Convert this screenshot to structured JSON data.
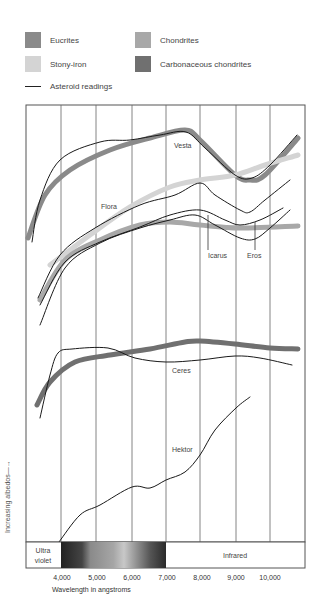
{
  "chart_data": {
    "type": "line",
    "title": "",
    "xlabel": "Wavelength in angstroms",
    "ylabel": "Increasing albedos",
    "xlim": [
      3000,
      11000
    ],
    "x_ticks": [
      "4,000",
      "5,000",
      "6,000",
      "7,000",
      "8,000",
      "9,000",
      "10,000"
    ],
    "grid": "vertical",
    "legend_position": "top",
    "legend": [
      {
        "label": "Eucrites",
        "color": "#8a8a8a",
        "kind": "band"
      },
      {
        "label": "Chondrites",
        "color": "#a8a8a8",
        "kind": "band"
      },
      {
        "label": "Stony-iron",
        "color": "#d4d4d4",
        "kind": "band"
      },
      {
        "label": "Carbonaceous chondrites",
        "color": "#707070",
        "kind": "band"
      },
      {
        "label": "Asteroid readings",
        "color": "#1a1a1a",
        "kind": "line"
      }
    ],
    "spectrum_band": {
      "left_label": [
        "Ultra",
        "violet"
      ],
      "right_label": "Infrared",
      "visible_range": [
        4000,
        7000
      ]
    },
    "series": [
      {
        "name": "Eucrites (meteorite band)",
        "kind": "band",
        "color": "#8a8a8a",
        "points": [
          [
            28,
            238
          ],
          [
            45,
            195
          ],
          [
            70,
            170
          ],
          [
            110,
            150
          ],
          [
            150,
            138
          ],
          [
            185,
            130
          ],
          [
            200,
            140
          ],
          [
            235,
            175
          ],
          [
            250,
            180
          ],
          [
            265,
            175
          ],
          [
            298,
            138
          ]
        ]
      },
      {
        "name": "Vesta",
        "kind": "reading",
        "label": "Vesta",
        "label_xy": [
          174,
          148
        ],
        "points": [
          [
            32,
            242
          ],
          [
            40,
            200
          ],
          [
            60,
            160
          ],
          [
            100,
            142
          ],
          [
            130,
            140
          ],
          [
            160,
            135
          ],
          [
            186,
            132
          ],
          [
            205,
            148
          ],
          [
            235,
            175
          ],
          [
            252,
            178
          ],
          [
            270,
            165
          ],
          [
            297,
            135
          ]
        ]
      },
      {
        "name": "Stony-iron (meteorite band)",
        "kind": "band",
        "color": "#d4d4d4",
        "points": [
          [
            50,
            265
          ],
          [
            90,
            235
          ],
          [
            130,
            207
          ],
          [
            170,
            187
          ],
          [
            200,
            180
          ],
          [
            235,
            175
          ],
          [
            265,
            165
          ],
          [
            298,
            155
          ]
        ]
      },
      {
        "name": "Flora",
        "kind": "reading",
        "label": "Flora",
        "label_xy": [
          101,
          209
        ],
        "points": [
          [
            38,
            298
          ],
          [
            60,
            255
          ],
          [
            95,
            228
          ],
          [
            140,
            205
          ],
          [
            175,
            195
          ],
          [
            200,
            183
          ],
          [
            215,
            195
          ],
          [
            240,
            210
          ],
          [
            250,
            212
          ],
          [
            265,
            200
          ],
          [
            290,
            180
          ]
        ]
      },
      {
        "name": "Chondrites (meteorite band)",
        "kind": "band",
        "color": "#a8a8a8",
        "points": [
          [
            40,
            300
          ],
          [
            65,
            260
          ],
          [
            100,
            240
          ],
          [
            140,
            225
          ],
          [
            170,
            222
          ],
          [
            200,
            225
          ],
          [
            240,
            228
          ],
          [
            298,
            226
          ]
        ]
      },
      {
        "name": "Icarus",
        "kind": "reading",
        "label": "Icarus",
        "label_xy": [
          208,
          258
        ],
        "leader": [
          [
            208,
            215
          ],
          [
            208,
            250
          ]
        ],
        "points": [
          [
            40,
            305
          ],
          [
            65,
            262
          ],
          [
            100,
            242
          ],
          [
            140,
            227
          ],
          [
            170,
            215
          ],
          [
            200,
            210
          ],
          [
            225,
            220
          ],
          [
            240,
            225
          ],
          [
            260,
            220
          ],
          [
            283,
            208
          ]
        ]
      },
      {
        "name": "Eros",
        "kind": "reading",
        "label": "Eros",
        "label_xy": [
          247,
          258
        ],
        "leader": [
          [
            255,
            222
          ],
          [
            255,
            250
          ]
        ],
        "points": [
          [
            40,
            325
          ],
          [
            65,
            268
          ],
          [
            100,
            243
          ],
          [
            140,
            228
          ],
          [
            170,
            220
          ],
          [
            195,
            215
          ],
          [
            215,
            225
          ],
          [
            240,
            238
          ],
          [
            255,
            239
          ],
          [
            270,
            228
          ],
          [
            290,
            210
          ]
        ]
      },
      {
        "name": "Carbonaceous chondrites (meteorite band)",
        "kind": "band",
        "color": "#707070",
        "points": [
          [
            37,
            405
          ],
          [
            50,
            382
          ],
          [
            75,
            362
          ],
          [
            110,
            355
          ],
          [
            150,
            349
          ],
          [
            185,
            342
          ],
          [
            200,
            341
          ],
          [
            235,
            344
          ],
          [
            270,
            348
          ],
          [
            298,
            349
          ]
        ]
      },
      {
        "name": "Ceres",
        "kind": "reading",
        "label": "Ceres",
        "label_xy": [
          172,
          373
        ],
        "points": [
          [
            40,
            418
          ],
          [
            50,
            375
          ],
          [
            58,
            353
          ],
          [
            72,
            349
          ],
          [
            108,
            348
          ],
          [
            135,
            358
          ],
          [
            166,
            362
          ],
          [
            200,
            360
          ],
          [
            235,
            356
          ],
          [
            260,
            358
          ],
          [
            292,
            365
          ]
        ]
      },
      {
        "name": "Hektor",
        "kind": "reading",
        "label": "Hektor",
        "label_xy": [
          172,
          452
        ],
        "points": [
          [
            59,
            542
          ],
          [
            80,
            515
          ],
          [
            100,
            505
          ],
          [
            132,
            487
          ],
          [
            150,
            488
          ],
          [
            166,
            480
          ],
          [
            185,
            472
          ],
          [
            200,
            455
          ],
          [
            215,
            430
          ],
          [
            236,
            408
          ],
          [
            250,
            397
          ]
        ]
      }
    ]
  }
}
